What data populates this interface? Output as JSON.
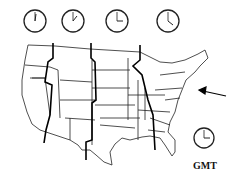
{
  "clocks": [
    {
      "zone": "pacific",
      "hour": 12,
      "minute": 0,
      "cx": 35,
      "cy": 21
    },
    {
      "zone": "mountain",
      "hour": 1,
      "minute": 0,
      "cx": 73,
      "cy": 21
    },
    {
      "zone": "central",
      "hour": 3,
      "minute": 0,
      "cx": 117,
      "cy": 21
    },
    {
      "zone": "eastern",
      "hour": 4,
      "minute": 0,
      "cx": 168,
      "cy": 21
    },
    {
      "zone": "gmt",
      "hour": 3,
      "minute": 0,
      "cx": 204,
      "cy": 138
    }
  ],
  "gmt_label": "GMT",
  "colors": {
    "ink": "#111111",
    "background": "#ffffff"
  }
}
